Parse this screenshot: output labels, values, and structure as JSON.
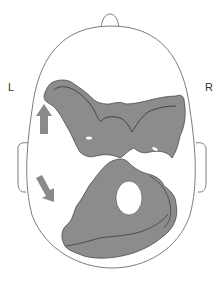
{
  "labels": {
    "left": "L",
    "right": "R"
  },
  "colors": {
    "background": "#ffffff",
    "outline": "#6e6e6e",
    "lesion_fill": "#8c8c8c",
    "lesion_edge": "#4a4a4a",
    "arrow": "#8a8a8a"
  },
  "figure": {
    "view": "head-top-view",
    "regions": [
      "upper-lesion",
      "lower-lesion"
    ],
    "arrows": [
      "arrow-up-left",
      "arrow-down-left"
    ]
  }
}
